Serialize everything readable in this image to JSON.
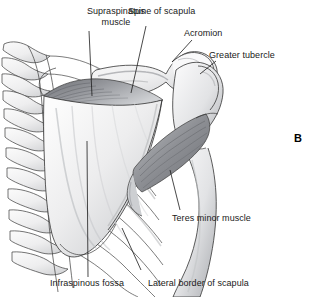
{
  "figure": {
    "panel_letter": "B",
    "view": "posterior-shoulder-scapula",
    "background_color": "#ffffff",
    "line_color": "#2b2b2b",
    "muscle_shade_dark": "#8d8f93",
    "muscle_shade_mid": "#b9bbbe",
    "bone_shade_light": "#f0f0f0"
  },
  "labels": [
    {
      "id": "supraspinatus-muscle",
      "line1": "Supraspinatus",
      "line2": "muscle",
      "text": "Supraspinatus muscle"
    },
    {
      "id": "spine-of-scapula",
      "line1": "Spine of scapula",
      "line2": "",
      "text": "Spine of scapula"
    },
    {
      "id": "acromion",
      "line1": "Acromion",
      "line2": "",
      "text": "Acromion"
    },
    {
      "id": "greater-tubercle",
      "line1": "Greater tubercle",
      "line2": "",
      "text": "Greater tubercle"
    },
    {
      "id": "teres-minor-muscle",
      "line1": "Teres minor muscle",
      "line2": "",
      "text": "Teres minor muscle"
    },
    {
      "id": "infraspinous-fossa",
      "line1": "Infraspinous fossa",
      "line2": "",
      "text": "Infraspinous fossa"
    },
    {
      "id": "lateral-border-of-scapula",
      "line1": "Lateral border of scapula",
      "line2": "",
      "text": "Lateral border of scapula"
    }
  ]
}
